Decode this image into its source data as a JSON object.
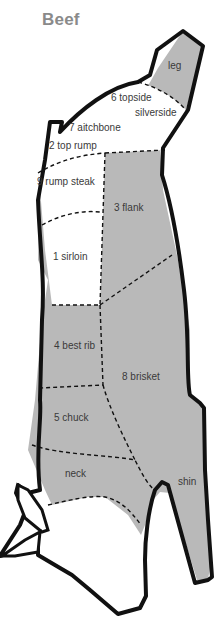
{
  "title": "Beef",
  "colors": {
    "shaded": "#b9b9b9",
    "unshaded": "#ffffff",
    "outline": "#111111",
    "title": "#8a8a8a",
    "label": "#3a3a3a"
  },
  "cuts": [
    {
      "id": "leg",
      "label": "leg",
      "shaded": true
    },
    {
      "id": "topside",
      "label": "6 topside",
      "shaded": false
    },
    {
      "id": "silverside",
      "label": "silverside",
      "shaded": false
    },
    {
      "id": "aitchbone",
      "label": "7 aitchbone",
      "shaded": false
    },
    {
      "id": "top-rump",
      "label": "2 top rump",
      "shaded": false
    },
    {
      "id": "rump-steak",
      "label": "9 rump steak",
      "shaded": false
    },
    {
      "id": "flank",
      "label": "3 flank",
      "shaded": true
    },
    {
      "id": "sirloin",
      "label": "1 sirloin",
      "shaded": false
    },
    {
      "id": "best-rib",
      "label": "4 best rib",
      "shaded": true
    },
    {
      "id": "brisket",
      "label": "8 brisket",
      "shaded": true
    },
    {
      "id": "chuck",
      "label": "5 chuck",
      "shaded": true
    },
    {
      "id": "neck",
      "label": "neck",
      "shaded": true
    },
    {
      "id": "shin",
      "label": "shin",
      "shaded": true
    }
  ]
}
